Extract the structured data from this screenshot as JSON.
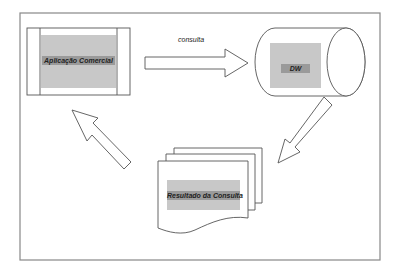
{
  "diagram": {
    "nodes": [
      {
        "id": "app",
        "label": "Aplicação Comercial",
        "shape": "process-box"
      },
      {
        "id": "dw",
        "label": "DW",
        "shape": "cylinder"
      },
      {
        "id": "result",
        "label": "Resultado da Consulta",
        "shape": "multi-document"
      }
    ],
    "edges": [
      {
        "from": "app",
        "to": "dw",
        "label": "consulta"
      },
      {
        "from": "dw",
        "to": "result",
        "label": ""
      },
      {
        "from": "result",
        "to": "app",
        "label": ""
      }
    ]
  },
  "colors": {
    "stroke": "#555555",
    "frame": "#888888",
    "grey_fill": "#c8c8c8",
    "label_band": "#9a9a9a",
    "background": "#ffffff"
  }
}
